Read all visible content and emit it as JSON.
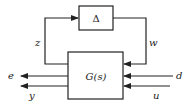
{
  "diagram": {
    "type": "block-diagram",
    "blocks": {
      "delta": {
        "label": "Δ"
      },
      "plant": {
        "label": "G(s)"
      }
    },
    "signals": {
      "z": "z",
      "w": "w",
      "e": "e",
      "y": "y",
      "d": "d",
      "u": "u"
    },
    "colors": {
      "line": "#222222",
      "background": "#ffffff"
    }
  }
}
